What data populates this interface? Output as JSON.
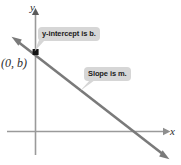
{
  "figure": {
    "axes": {
      "x_label": "x",
      "y_label": "y",
      "axis_color": "#9a9a9a"
    },
    "line": {
      "color": "#7a7a7a",
      "description": "descending straight line with arrowheads at both ends"
    },
    "point": {
      "label": "(0, b)",
      "marker": "square-point-marker",
      "color": "#1a1a1a"
    },
    "callouts": [
      {
        "id": "y-intercept",
        "text": "y-intercept is b.",
        "background": "#d6d6d6"
      },
      {
        "id": "slope",
        "text": "Slope is m.",
        "background": "#d6d6d6"
      }
    ]
  }
}
